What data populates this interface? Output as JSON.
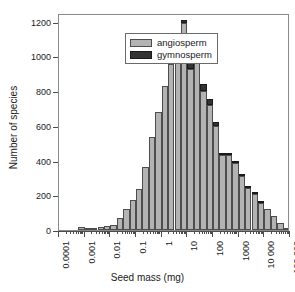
{
  "chart_data": {
    "type": "bar",
    "subtype": "stacked-histogram",
    "title": "",
    "xlabel": "Seed mass (mg)",
    "ylabel": "Number of species",
    "xscale": "log",
    "xlim": [
      0.0001,
      100000
    ],
    "ylim": [
      0,
      1250
    ],
    "yticks": [
      0,
      200,
      400,
      600,
      800,
      1000,
      1200
    ],
    "ytick_labels": [
      "0",
      "200",
      "400",
      "600",
      "800",
      "1000",
      "1200"
    ],
    "xticks": [
      0.0001,
      0.001,
      0.01,
      0.1,
      1,
      10,
      100,
      1000,
      10000,
      100000
    ],
    "xtick_labels": [
      "0.0001",
      "0.001",
      "0.01",
      "0.1",
      "1",
      "10",
      "100",
      "1000",
      "10 000",
      "100 000"
    ],
    "grid": false,
    "legend_position": "top-left",
    "legend": [
      "angiosperm",
      "gymnosperm"
    ],
    "colors": {
      "angiosperm": "#b3b3b3",
      "gymnosperm": "#333333",
      "axis": "#4d4d4d",
      "frame": "#8a8a8a",
      "background": "#ffffff"
    },
    "bin_width_decades": 0.25,
    "bin_left_edges_log10": [
      -3.25,
      -3.0,
      -2.75,
      -2.5,
      -2.25,
      -2.0,
      -1.75,
      -1.5,
      -1.25,
      -1.0,
      -0.75,
      -0.5,
      -0.25,
      0.0,
      0.25,
      0.5,
      0.75,
      1.0,
      1.25,
      1.5,
      1.75,
      2.0,
      2.25,
      2.5,
      2.75,
      3.0,
      3.25,
      3.5,
      3.75,
      4.0,
      4.25,
      4.5,
      4.75
    ],
    "series": [
      {
        "name": "angiosperm",
        "values": [
          15,
          10,
          12,
          18,
          22,
          30,
          68,
          120,
          175,
          238,
          365,
          538,
          680,
          828,
          955,
          1112,
          1190,
          930,
          965,
          800,
          718,
          600,
          432,
          430,
          385,
          310,
          240,
          210,
          158,
          120,
          78,
          40,
          12
        ]
      },
      {
        "name": "gymnosperm",
        "values": [
          0,
          0,
          0,
          0,
          0,
          0,
          0,
          0,
          0,
          0,
          0,
          0,
          0,
          0,
          5,
          8,
          22,
          30,
          32,
          42,
          38,
          22,
          12,
          8,
          6,
          5,
          3,
          2,
          1,
          0,
          0,
          0,
          0
        ]
      }
    ],
    "totals": [
      15,
      10,
      12,
      18,
      22,
      30,
      68,
      120,
      175,
      238,
      365,
      538,
      680,
      828,
      960,
      1120,
      1212,
      960,
      997,
      842,
      756,
      622,
      444,
      438,
      391,
      315,
      243,
      212,
      159,
      120,
      78,
      40,
      12
    ]
  },
  "legend": {
    "items": [
      {
        "label": "angiosperm",
        "key": "angiosperm"
      },
      {
        "label": "gymnosperm",
        "key": "gymnosperm"
      }
    ]
  },
  "axes": {
    "x_title": "Seed mass (mg)",
    "y_title": "Number of species"
  }
}
